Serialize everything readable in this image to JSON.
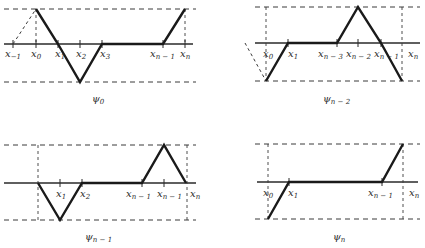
{
  "figure": {
    "panels": [
      {
        "id": "psi_0",
        "caption": {
          "base": "ψ",
          "sub": "0"
        },
        "labels": [
          {
            "base": "x",
            "sub": "−1"
          },
          {
            "base": "x",
            "sub": "0"
          },
          {
            "base": "x",
            "sub": "1"
          },
          {
            "base": "x",
            "sub": "2"
          },
          {
            "base": "x",
            "sub": "3"
          },
          {
            "base": "x",
            "sub": "n − 1"
          },
          {
            "base": "x",
            "sub": "n"
          }
        ]
      },
      {
        "id": "psi_n_minus_2",
        "caption": {
          "base": "ψ",
          "sub": "n − 2"
        },
        "labels": [
          {
            "base": "x",
            "sub": "0"
          },
          {
            "base": "x",
            "sub": "1"
          },
          {
            "base": "x",
            "sub": "n − 3"
          },
          {
            "base": "x",
            "sub": "n − 2"
          },
          {
            "base": "x",
            "sub": "n − 1"
          },
          {
            "base": "x",
            "sub": "n"
          }
        ]
      },
      {
        "id": "psi_n_minus_1",
        "caption": {
          "base": "ψ",
          "sub": "n − 1"
        },
        "labels": [
          {
            "base": "x",
            "sub": "1"
          },
          {
            "base": "x",
            "sub": "2"
          },
          {
            "base": "x",
            "sub": "n − 1"
          },
          {
            "base": "x",
            "sub": "n − 1"
          },
          {
            "base": "x",
            "sub": "n"
          }
        ]
      },
      {
        "id": "psi_n",
        "caption": {
          "base": "ψ",
          "sub": "n"
        },
        "labels": [
          {
            "base": "x",
            "sub": "0"
          },
          {
            "base": "x",
            "sub": "1"
          },
          {
            "base": "x",
            "sub": "n − 1"
          },
          {
            "base": "x",
            "sub": "n"
          }
        ]
      }
    ]
  }
}
